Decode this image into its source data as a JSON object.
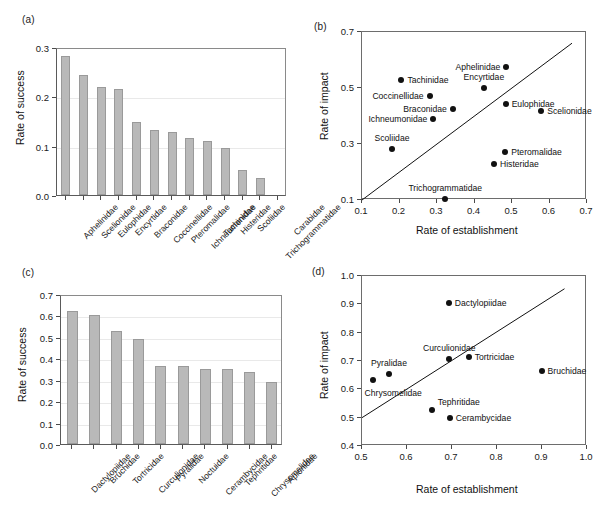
{
  "figure": {
    "caption_fragment": ""
  },
  "panels": {
    "a": {
      "letter": "(a)",
      "ylabel": "Rate of success",
      "yticks": [
        "0.0",
        "0.1",
        "0.2",
        "0.3"
      ]
    },
    "b": {
      "letter": "(b)",
      "ylabel": "Rate of impact",
      "xlabel": "Rate of establishment",
      "yticks": [
        "0.1",
        "0.3",
        "0.5",
        "0.7"
      ],
      "xticks": [
        "0.1",
        "0.2",
        "0.3",
        "0.4",
        "0.5",
        "0.6",
        "0.7"
      ]
    },
    "c": {
      "letter": "(c)",
      "ylabel": "Rate of success",
      "yticks": [
        "0.0",
        "0.1",
        "0.2",
        "0.3",
        "0.4",
        "0.5",
        "0.6",
        "0.7"
      ]
    },
    "d": {
      "letter": "(d)",
      "ylabel": "Rate of impact",
      "xlabel": "Rate of establishment",
      "yticks": [
        "0.4",
        "0.5",
        "0.6",
        "0.7",
        "0.8",
        "0.9",
        "1.0"
      ],
      "xticks": [
        "0.5",
        "0.6",
        "0.7",
        "0.8",
        "0.9",
        "1.0"
      ]
    }
  },
  "chart_data": [
    {
      "panel": "a",
      "type": "bar",
      "title": "",
      "xlabel": "",
      "ylabel": "Rate of success",
      "ylim": [
        0.0,
        0.3
      ],
      "ytick_values": [
        0.0,
        0.1,
        0.2,
        0.3
      ],
      "grid": true,
      "bar_color": "#b9b9b9",
      "categories": [
        "Aphelinidae",
        "Scelionidae",
        "Eulophidae",
        "Encyrtidae",
        "Braconidae",
        "Coccinellidae",
        "Pteromalidae",
        "Ichneumonidae",
        "Tachinidae",
        "Histeridae",
        "Scoliidae",
        "Trichogrammatidae",
        "Carabidae"
      ],
      "values": [
        0.281,
        0.244,
        0.218,
        0.214,
        0.148,
        0.132,
        0.128,
        0.116,
        0.109,
        0.096,
        0.051,
        0.035,
        0.0
      ]
    },
    {
      "panel": "b",
      "type": "scatter",
      "title": "",
      "xlabel": "Rate of establishment",
      "ylabel": "Rate of impact",
      "xlim": [
        0.1,
        0.7
      ],
      "ylim": [
        0.1,
        0.7
      ],
      "xtick_values": [
        0.1,
        0.2,
        0.3,
        0.4,
        0.5,
        0.6,
        0.7
      ],
      "ytick_values": [
        0.1,
        0.3,
        0.5,
        0.7
      ],
      "grid": false,
      "reference_line": {
        "type": "identity",
        "from": [
          0.1,
          0.1
        ],
        "to": [
          0.66,
          0.66
        ]
      },
      "points": [
        {
          "label": "Aphelinidae",
          "x": 0.485,
          "y": 0.575,
          "label_pos": "left"
        },
        {
          "label": "Tachinidae",
          "x": 0.205,
          "y": 0.53,
          "label_pos": "right"
        },
        {
          "label": "Encyrtidae",
          "x": 0.425,
          "y": 0.5,
          "label_pos": "above"
        },
        {
          "label": "Coccinellidae",
          "x": 0.28,
          "y": 0.47,
          "label_pos": "left"
        },
        {
          "label": "Eulophidae",
          "x": 0.483,
          "y": 0.443,
          "label_pos": "right"
        },
        {
          "label": "Braconidae",
          "x": 0.342,
          "y": 0.425,
          "label_pos": "left"
        },
        {
          "label": "Scelionidae",
          "x": 0.578,
          "y": 0.417,
          "label_pos": "right"
        },
        {
          "label": "Ichneumonidae",
          "x": 0.29,
          "y": 0.39,
          "label_pos": "left"
        },
        {
          "label": "Scoliidae",
          "x": 0.18,
          "y": 0.283,
          "label_pos": "above"
        },
        {
          "label": "Pteromalidae",
          "x": 0.482,
          "y": 0.272,
          "label_pos": "right"
        },
        {
          "label": "Histeridae",
          "x": 0.452,
          "y": 0.228,
          "label_pos": "right"
        },
        {
          "label": "Trichogrammatidae",
          "x": 0.322,
          "y": 0.102,
          "label_pos": "above"
        }
      ]
    },
    {
      "panel": "c",
      "type": "bar",
      "title": "",
      "xlabel": "",
      "ylabel": "Rate of success",
      "ylim": [
        0.0,
        0.7
      ],
      "ytick_values": [
        0.0,
        0.1,
        0.2,
        0.3,
        0.4,
        0.5,
        0.6,
        0.7
      ],
      "grid": true,
      "bar_color": "#b9b9b9",
      "categories": [
        "Dactylopiidae",
        "Bruchidae",
        "Tortricidae",
        "Curculionidae",
        "Pyralidae",
        "Noctuidae",
        "Cerambycidae",
        "Tephritidae",
        "Chrysomelidae",
        "Apionidae"
      ],
      "values": [
        0.622,
        0.6,
        0.527,
        0.491,
        0.365,
        0.364,
        0.349,
        0.348,
        0.336,
        0.29
      ]
    },
    {
      "panel": "d",
      "type": "scatter",
      "title": "",
      "xlabel": "Rate of establishment",
      "ylabel": "Rate of impact",
      "xlim": [
        0.5,
        1.0
      ],
      "ylim": [
        0.4,
        1.0
      ],
      "xtick_values": [
        0.5,
        0.6,
        0.7,
        0.8,
        0.9,
        1.0
      ],
      "ytick_values": [
        0.4,
        0.5,
        0.6,
        0.7,
        0.8,
        0.9,
        1.0
      ],
      "grid": false,
      "reference_line": {
        "type": "fit",
        "from": [
          0.5,
          0.5
        ],
        "to": [
          0.95,
          0.955
        ]
      },
      "points": [
        {
          "label": "Dactylopiidae",
          "x": 0.693,
          "y": 0.903,
          "label_pos": "right"
        },
        {
          "label": "Tortricidae",
          "x": 0.737,
          "y": 0.713,
          "label_pos": "right"
        },
        {
          "label": "Curculionidae",
          "x": 0.694,
          "y": 0.707,
          "label_pos": "above"
        },
        {
          "label": "Bruchidae",
          "x": 0.899,
          "y": 0.666,
          "label_pos": "right"
        },
        {
          "label": "Pyralidae",
          "x": 0.56,
          "y": 0.653,
          "label_pos": "above"
        },
        {
          "label": "Chrysomelidae",
          "x": 0.525,
          "y": 0.633,
          "label_pos": "below"
        },
        {
          "label": "Tephritidae",
          "x": 0.655,
          "y": 0.527,
          "label_pos": "above-right"
        },
        {
          "label": "Cerambycidae",
          "x": 0.695,
          "y": 0.499,
          "label_pos": "right"
        }
      ]
    }
  ]
}
